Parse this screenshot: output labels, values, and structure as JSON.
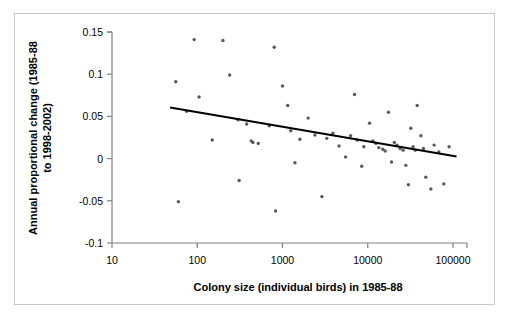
{
  "chart_data": {
    "type": "scatter",
    "title": "",
    "xlabel": "Colony size (individual birds) in 1985-88",
    "ylabel": "Annual proportional change (1985-88 to 1998-2002)",
    "xscale": "log",
    "yscale": "linear",
    "xlim": [
      10,
      100000
    ],
    "ylim": [
      -0.1,
      0.15
    ],
    "xticks": [
      10,
      100,
      1000,
      10000,
      100000
    ],
    "xtick_labels": [
      "10",
      "100",
      "1000",
      "10000",
      "100000"
    ],
    "yticks": [
      -0.1,
      -0.05,
      0,
      0.05,
      0.1,
      0.15
    ],
    "ytick_labels": [
      "-0.1",
      "-0.05",
      "0",
      "0.05",
      "0.1",
      "0.15"
    ],
    "grid": false,
    "legend": false,
    "marker_color": "#595959",
    "trendline_color": "#000000",
    "axis_color": "#808080",
    "points": [
      {
        "x": 56,
        "y": 0.091
      },
      {
        "x": 60,
        "y": -0.051
      },
      {
        "x": 75,
        "y": 0.056
      },
      {
        "x": 92,
        "y": 0.141
      },
      {
        "x": 105,
        "y": 0.073
      },
      {
        "x": 150,
        "y": 0.022
      },
      {
        "x": 200,
        "y": 0.14
      },
      {
        "x": 240,
        "y": 0.099
      },
      {
        "x": 300,
        "y": 0.046
      },
      {
        "x": 310,
        "y": -0.026
      },
      {
        "x": 380,
        "y": 0.041
      },
      {
        "x": 430,
        "y": 0.021
      },
      {
        "x": 450,
        "y": 0.019
      },
      {
        "x": 520,
        "y": 0.018
      },
      {
        "x": 700,
        "y": 0.039
      },
      {
        "x": 800,
        "y": 0.132
      },
      {
        "x": 830,
        "y": -0.062
      },
      {
        "x": 1000,
        "y": 0.086
      },
      {
        "x": 1150,
        "y": 0.063
      },
      {
        "x": 1250,
        "y": 0.033
      },
      {
        "x": 1400,
        "y": -0.005
      },
      {
        "x": 1600,
        "y": 0.023
      },
      {
        "x": 2000,
        "y": 0.048
      },
      {
        "x": 2400,
        "y": 0.028
      },
      {
        "x": 2900,
        "y": -0.045
      },
      {
        "x": 3300,
        "y": 0.024
      },
      {
        "x": 3900,
        "y": 0.03
      },
      {
        "x": 4600,
        "y": 0.015
      },
      {
        "x": 5500,
        "y": 0.002
      },
      {
        "x": 6300,
        "y": 0.027
      },
      {
        "x": 7000,
        "y": 0.076
      },
      {
        "x": 7500,
        "y": 0.022
      },
      {
        "x": 8500,
        "y": -0.009
      },
      {
        "x": 9000,
        "y": 0.014
      },
      {
        "x": 10500,
        "y": 0.042
      },
      {
        "x": 11500,
        "y": 0.021
      },
      {
        "x": 12500,
        "y": 0.018
      },
      {
        "x": 13500,
        "y": 0.013
      },
      {
        "x": 15000,
        "y": 0.011
      },
      {
        "x": 16000,
        "y": 0.009
      },
      {
        "x": 17500,
        "y": 0.055
      },
      {
        "x": 19000,
        "y": -0.004
      },
      {
        "x": 20500,
        "y": 0.019
      },
      {
        "x": 22000,
        "y": 0.016
      },
      {
        "x": 24000,
        "y": 0.012
      },
      {
        "x": 26000,
        "y": 0.01
      },
      {
        "x": 28000,
        "y": -0.008
      },
      {
        "x": 30000,
        "y": -0.031
      },
      {
        "x": 32000,
        "y": 0.036
      },
      {
        "x": 34000,
        "y": 0.014
      },
      {
        "x": 36000,
        "y": 0.01
      },
      {
        "x": 38000,
        "y": 0.063
      },
      {
        "x": 42000,
        "y": 0.027
      },
      {
        "x": 45000,
        "y": 0.012
      },
      {
        "x": 48000,
        "y": -0.022
      },
      {
        "x": 55000,
        "y": -0.036
      },
      {
        "x": 60000,
        "y": 0.016
      },
      {
        "x": 68000,
        "y": 0.008
      },
      {
        "x": 78000,
        "y": -0.03
      },
      {
        "x": 90000,
        "y": 0.014
      }
    ],
    "trendline": {
      "x_start": 48,
      "y_start": 0.0605,
      "x_end": 110000,
      "y_end": 0.0025
    }
  }
}
